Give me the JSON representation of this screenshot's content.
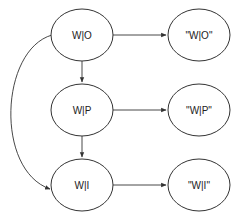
{
  "diagram": {
    "type": "directed-graph",
    "nodes": [
      {
        "id": "wo",
        "label": "W|O",
        "cx": 82,
        "cy": 35
      },
      {
        "id": "wo_q",
        "label": "\"W|O\"",
        "cx": 199,
        "cy": 35
      },
      {
        "id": "wp",
        "label": "W|P",
        "cx": 82,
        "cy": 110
      },
      {
        "id": "wp_q",
        "label": "\"W|P\"",
        "cx": 199,
        "cy": 110
      },
      {
        "id": "wi",
        "label": "W|I",
        "cx": 82,
        "cy": 185
      },
      {
        "id": "wi_q",
        "label": "\"W|I\"",
        "cx": 199,
        "cy": 185
      }
    ],
    "edges": [
      {
        "from": "wo",
        "to": "wo_q"
      },
      {
        "from": "wp",
        "to": "wp_q"
      },
      {
        "from": "wi",
        "to": "wi_q"
      },
      {
        "from": "wo",
        "to": "wp"
      },
      {
        "from": "wp",
        "to": "wi"
      },
      {
        "from": "wo",
        "to": "wi",
        "curved": true
      }
    ],
    "colors": {
      "stroke": "#333333",
      "text": "#222222",
      "background": "#ffffff"
    }
  }
}
